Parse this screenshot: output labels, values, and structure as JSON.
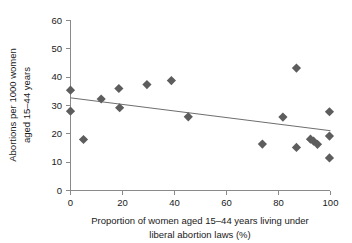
{
  "chart_data": {
    "type": "scatter",
    "title": "",
    "xlabel": "Proportion of women aged 15–44 years living under liberal abortion laws (%)",
    "xlabel_line1": "Proportion of women aged 15–44 years living under",
    "xlabel_line2": "liberal abortion laws (%)",
    "ylabel": "Abortions per 1000 women aged 15–44 years",
    "ylabel_line1": "Abortions per 1000 women",
    "ylabel_line2": "aged 15–44 years",
    "xlim": [
      0,
      100
    ],
    "ylim": [
      0,
      60
    ],
    "xticks": [
      0,
      20,
      40,
      60,
      80,
      100
    ],
    "yticks": [
      0,
      10,
      20,
      30,
      40,
      50,
      60
    ],
    "xtick_labels": [
      "0",
      "20",
      "40",
      "60",
      "80",
      "100"
    ],
    "ytick_labels": [
      "0",
      "10",
      "20",
      "30",
      "40",
      "50",
      "60"
    ],
    "grid": false,
    "legend": "none",
    "marker_shape": "diamond",
    "marker_color": "#5d5d5d",
    "trend_color": "#6e6e6e",
    "axis_color": "#8a8a8a",
    "points": [
      {
        "x": 0.0,
        "y": 35.4
      },
      {
        "x": 0.0,
        "y": 28.0
      },
      {
        "x": 5.0,
        "y": 18.0
      },
      {
        "x": 11.8,
        "y": 32.3
      },
      {
        "x": 18.6,
        "y": 36.0
      },
      {
        "x": 18.9,
        "y": 29.2
      },
      {
        "x": 29.4,
        "y": 37.4
      },
      {
        "x": 38.8,
        "y": 38.8
      },
      {
        "x": 45.3,
        "y": 26.0
      },
      {
        "x": 73.8,
        "y": 16.4
      },
      {
        "x": 81.7,
        "y": 25.9
      },
      {
        "x": 86.9,
        "y": 43.2
      },
      {
        "x": 86.9,
        "y": 15.2
      },
      {
        "x": 92.3,
        "y": 18.1
      },
      {
        "x": 93.5,
        "y": 17.4
      },
      {
        "x": 95.0,
        "y": 16.3
      },
      {
        "x": 99.6,
        "y": 27.8
      },
      {
        "x": 99.6,
        "y": 19.2
      },
      {
        "x": 99.6,
        "y": 11.5
      }
    ],
    "trend_series": {
      "name": "linear fit",
      "x": [
        0,
        100
      ],
      "y": [
        32.7,
        21.1
      ]
    }
  }
}
